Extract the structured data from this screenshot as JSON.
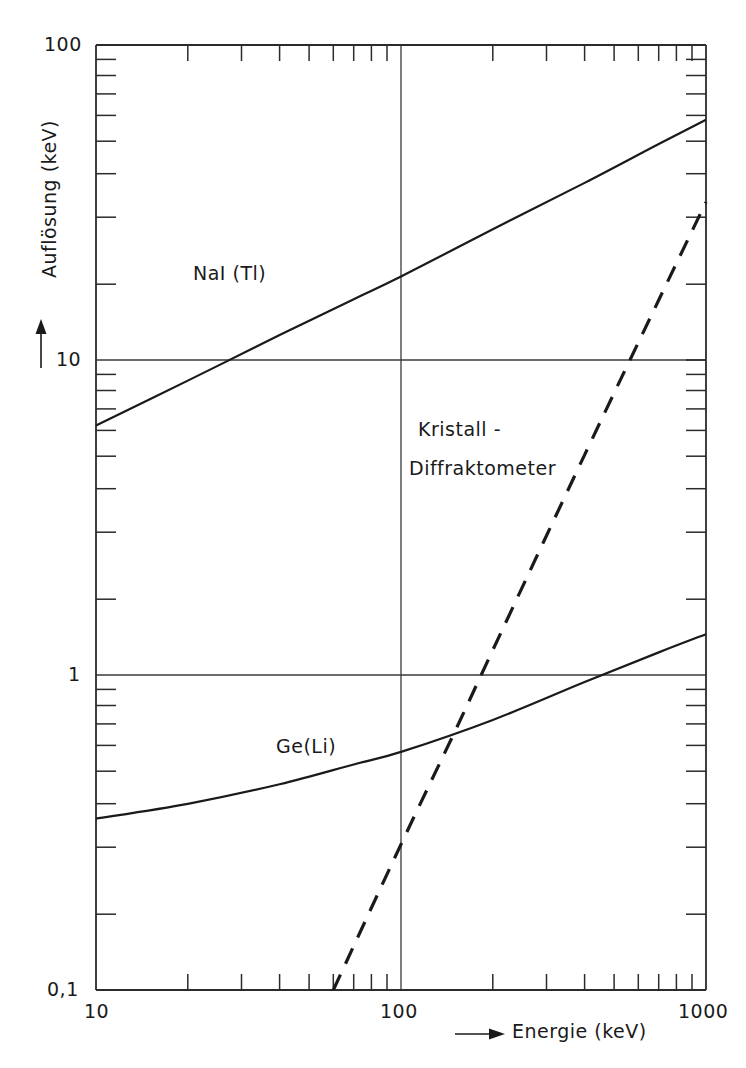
{
  "chart_data": {
    "type": "line",
    "title": "",
    "xlabel": "Energie (keV)",
    "ylabel": "Auflösung (keV)",
    "xscale": "log",
    "yscale": "log",
    "xlim": [
      10,
      1000
    ],
    "ylim": [
      0.1,
      100
    ],
    "xticks": [
      "10",
      "100",
      "1000"
    ],
    "xtick_values": [
      10,
      100,
      1000
    ],
    "yticks": [
      "0,1",
      "1",
      "10",
      "100"
    ],
    "ytick_values": [
      0.1,
      1,
      10,
      100
    ],
    "grid": "major gridlines at y=1, y=10 and x=100",
    "legend": "inline curve annotations",
    "series": [
      {
        "name": "NaI (Tl)",
        "style": "solid",
        "label_text": "NaI (Tl)",
        "x": [
          10,
          20,
          40,
          70,
          100,
          200,
          400,
          700,
          1150
        ],
        "y": [
          6.2,
          8.6,
          12.0,
          15.6,
          18.4,
          26.0,
          36.5,
          48.5,
          62.0
        ]
      },
      {
        "name": "Ge(Li)",
        "style": "solid",
        "label_text": "Ge(Li)",
        "x": [
          10,
          20,
          40,
          70,
          100,
          200,
          400,
          700,
          1150
        ],
        "y": [
          0.35,
          0.39,
          0.45,
          0.52,
          0.57,
          0.72,
          0.95,
          1.18,
          1.42
        ]
      },
      {
        "name": "Kristall - Diffraktometer",
        "style": "dashed",
        "label_text_line1": "Kristall -",
        "label_text_line2": "Diffraktometer",
        "x": [
          60,
          100,
          150,
          200,
          400,
          700,
          1150
        ],
        "y": [
          0.1,
          0.29,
          0.66,
          1.2,
          5.0,
          15.5,
          42.0
        ]
      }
    ],
    "annotations": [
      {
        "text": "NaI (Tl)",
        "x": 28,
        "y": 20
      },
      {
        "text": "Ge(Li)",
        "x": 65,
        "y": 0.72
      },
      {
        "text": "Kristall -",
        "x": 125,
        "y": 3.1
      },
      {
        "text": "Diffraktometer",
        "x": 118,
        "y": 2.3
      }
    ],
    "colors": {
      "ink": "#1a1a1a",
      "axis": "#2b2b2b",
      "grid": "#3a3a3a",
      "background": "#ffffff"
    }
  },
  "axes": {
    "x": {
      "title": "Energie (keV)",
      "arrow": "arrow-right",
      "tick_labels": [
        "10",
        "100",
        "1000"
      ]
    },
    "y": {
      "title": "Auflösung (keV)",
      "arrow": "arrow-up",
      "tick_labels": [
        "100",
        "10",
        "1",
        "0,1"
      ]
    }
  },
  "curve_labels": {
    "nai": "NaI (Tl)",
    "geli": "Ge(Li)",
    "kristall_line1": "Kristall -",
    "kristall_line2": "Diffraktometer"
  }
}
